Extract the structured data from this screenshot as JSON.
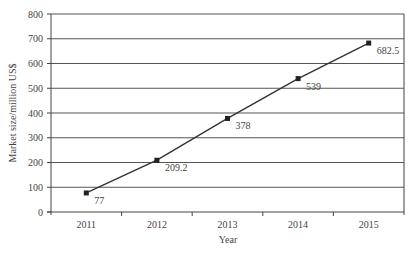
{
  "chart_data": {
    "type": "line",
    "title": "",
    "xlabel": "Year",
    "ylabel": "Market size/million US$",
    "categories": [
      "2011",
      "2012",
      "2013",
      "2014",
      "2015"
    ],
    "series": [
      {
        "name": "Market size",
        "values": [
          77,
          209.2,
          378,
          539,
          682.5
        ]
      }
    ],
    "data_labels": [
      "77",
      "209.2",
      "378",
      "539",
      "682.5"
    ],
    "ylim": [
      0,
      800
    ],
    "yticks": [
      0,
      100,
      200,
      300,
      400,
      500,
      600,
      700,
      800
    ],
    "grid": true,
    "legend": "none",
    "colors": {
      "line": "#333333",
      "grid": "#555555",
      "axis": "#444444"
    }
  }
}
